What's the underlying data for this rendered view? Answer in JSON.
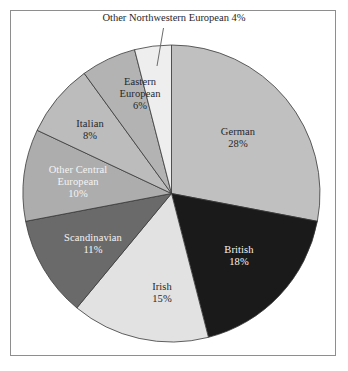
{
  "chart_data": {
    "type": "pie",
    "title": "",
    "xlabel": "",
    "ylabel": "",
    "legend_position": "none",
    "grid": false,
    "labels_inside_slices": true,
    "start_angle_deg": 0,
    "direction": "clockwise",
    "categories": [
      "German",
      "British",
      "Irish",
      "Scandinavian",
      "Other Central European",
      "Italian",
      "Eastern European",
      "Other Northwestern European"
    ],
    "values": [
      28,
      18,
      15,
      11,
      10,
      8,
      6,
      4
    ],
    "value_suffix": "%",
    "slices": [
      {
        "name": "German",
        "value": 28,
        "value_text": "28%",
        "color": "#c0c0c0",
        "text_color": "#27272a",
        "label_placement": "inside",
        "label_lines": [
          "German",
          "28%"
        ]
      },
      {
        "name": "British",
        "value": 18,
        "value_text": "18%",
        "color": "#1a1a1a",
        "text_color": "#f4f4f4",
        "label_placement": "inside",
        "label_lines": [
          "British",
          "18%"
        ]
      },
      {
        "name": "Irish",
        "value": 15,
        "value_text": "15%",
        "color": "#e2e2e2",
        "text_color": "#27272a",
        "label_placement": "inside",
        "label_lines": [
          "Irish",
          "15%"
        ]
      },
      {
        "name": "Scandinavian",
        "value": 11,
        "value_text": "11%",
        "color": "#6a6a6a",
        "text_color": "#f4f4f4",
        "label_placement": "inside",
        "label_lines": [
          "Scandinavian",
          "11%"
        ]
      },
      {
        "name": "Other Central European",
        "value": 10,
        "value_text": "10%",
        "color": "#adadad",
        "text_color": "#f4f4f4",
        "label_placement": "inside",
        "label_lines": [
          "Other Central",
          "European",
          "10%"
        ]
      },
      {
        "name": "Italian",
        "value": 8,
        "value_text": "8%",
        "color": "#bcbcbc",
        "text_color": "#27272a",
        "label_placement": "inside",
        "label_lines": [
          "Italian",
          "8%"
        ]
      },
      {
        "name": "Eastern European",
        "value": 6,
        "value_text": "6%",
        "color": "#b3b3b3",
        "text_color": "#27272a",
        "label_placement": "inside",
        "label_lines": [
          "Eastern",
          "European",
          "6%"
        ]
      },
      {
        "name": "Other Northwestern European",
        "value": 4,
        "value_text": "4%",
        "color": "#eeeeee",
        "text_color": "#27272a",
        "label_placement": "outside-with-leader",
        "label_lines": [
          "Other Northwestern European 4%"
        ]
      }
    ]
  },
  "external_label": {
    "text": "Other Northwestern European 4%"
  },
  "labels": {
    "german": {
      "name": "German",
      "pct": "28%"
    },
    "british": {
      "name": "British",
      "pct": "18%"
    },
    "irish": {
      "name": "Irish",
      "pct": "15%"
    },
    "scandinavian": {
      "name": "Scandinavian",
      "pct": "11%"
    },
    "other_central": {
      "line1": "Other Central",
      "line2": "European",
      "pct": "10%"
    },
    "italian": {
      "name": "Italian",
      "pct": "8%"
    },
    "eastern": {
      "line1": "Eastern",
      "line2": "European",
      "pct": "6%"
    }
  },
  "style": {
    "frame_color": "#8e8e8e",
    "slice_outline": "#3a3a3a",
    "background": "#ffffff",
    "leader_line_color": "#6b6b6b"
  }
}
